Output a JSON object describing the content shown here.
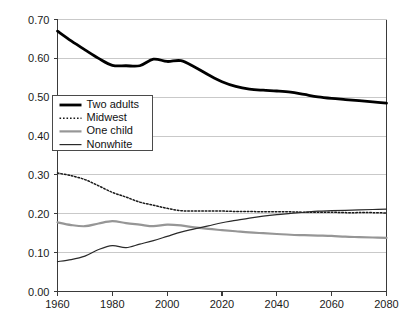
{
  "chart_data": {
    "type": "line",
    "title": "",
    "subtitle": "",
    "xlabel": "",
    "ylabel": "",
    "xlim": [
      1960,
      2080
    ],
    "ylim": [
      0.0,
      0.7
    ],
    "grid": true,
    "grid_axis": "y",
    "legend_position": "upper-left-inside",
    "x_ticks": [
      "1960",
      "1980",
      "2000",
      "2020",
      "2040",
      "2060",
      "2080"
    ],
    "x_tick_values": [
      1960,
      1980,
      2000,
      2020,
      2040,
      2060,
      2080
    ],
    "y_ticks": [
      "0.00",
      "0.10",
      "0.20",
      "0.30",
      "0.40",
      "0.50",
      "0.60",
      "0.70"
    ],
    "y_tick_values": [
      0.0,
      0.1,
      0.2,
      0.3,
      0.4,
      0.5,
      0.6,
      0.7
    ],
    "x": [
      1960,
      1965,
      1970,
      1975,
      1980,
      1985,
      1990,
      1995,
      2000,
      2005,
      2010,
      2015,
      2020,
      2025,
      2030,
      2035,
      2040,
      2045,
      2050,
      2055,
      2060,
      2065,
      2070,
      2075,
      2080
    ],
    "series": [
      {
        "name": "Two adults",
        "style": "thick-solid",
        "color": "#000000",
        "width": 2.8,
        "values": [
          0.67,
          0.645,
          0.622,
          0.6,
          0.582,
          0.581,
          0.581,
          0.598,
          0.592,
          0.594,
          0.578,
          0.558,
          0.54,
          0.528,
          0.521,
          0.518,
          0.516,
          0.513,
          0.507,
          0.501,
          0.497,
          0.494,
          0.491,
          0.488,
          0.485
        ]
      },
      {
        "name": "Midwest",
        "style": "dotted",
        "color": "#1a1a1a",
        "width": 1.5,
        "values": [
          0.305,
          0.298,
          0.288,
          0.272,
          0.255,
          0.243,
          0.23,
          0.222,
          0.214,
          0.208,
          0.207,
          0.207,
          0.207,
          0.206,
          0.206,
          0.205,
          0.205,
          0.205,
          0.204,
          0.204,
          0.204,
          0.203,
          0.203,
          0.203,
          0.202
        ]
      },
      {
        "name": "One child",
        "style": "solid-gray",
        "color": "#969696",
        "width": 2.2,
        "values": [
          0.178,
          0.171,
          0.168,
          0.175,
          0.181,
          0.176,
          0.172,
          0.168,
          0.172,
          0.17,
          0.165,
          0.161,
          0.158,
          0.155,
          0.152,
          0.15,
          0.148,
          0.146,
          0.145,
          0.144,
          0.143,
          0.141,
          0.14,
          0.139,
          0.138
        ]
      },
      {
        "name": "Nonwhite",
        "style": "thin-solid",
        "color": "#2a2a2a",
        "width": 1.2,
        "values": [
          0.077,
          0.082,
          0.091,
          0.108,
          0.118,
          0.113,
          0.122,
          0.131,
          0.142,
          0.153,
          0.161,
          0.169,
          0.177,
          0.183,
          0.189,
          0.194,
          0.198,
          0.201,
          0.204,
          0.207,
          0.208,
          0.209,
          0.21,
          0.211,
          0.212
        ]
      }
    ],
    "legend_entries": [
      {
        "label": "Two adults",
        "style": "thick-solid",
        "color": "#000000"
      },
      {
        "label": "Midwest",
        "style": "dotted",
        "color": "#1a1a1a"
      },
      {
        "label": "One child",
        "style": "solid-gray",
        "color": "#969696"
      },
      {
        "label": "Nonwhite",
        "style": "thin-solid",
        "color": "#2a2a2a"
      }
    ]
  },
  "colors": {
    "background": "#ffffff",
    "gridline": "#c9c9c9",
    "axis": "#3a3a3a",
    "text": "#1a1a1a"
  }
}
